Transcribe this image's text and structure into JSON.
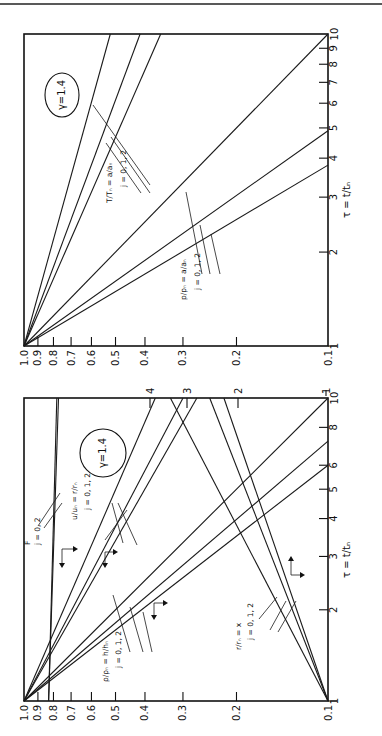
{
  "figure": {
    "orientation": "rotated 90 degrees counter-clockwise",
    "panel_count": 2
  },
  "chart_data": [
    {
      "type": "line",
      "panel": "top",
      "title": "",
      "annotation": "γ=1.4",
      "xlabel": "τ = t / t_n",
      "ylabel": "",
      "xscale": "log",
      "yscale": "log",
      "xlim": [
        1,
        10
      ],
      "ylim": [
        0.1,
        1.0
      ],
      "x_ticks": [
        "1",
        "2",
        "3",
        "4",
        "5",
        "6",
        "7",
        "8",
        "9",
        "10"
      ],
      "y_ticks": [
        "1.0",
        "0.9",
        "0.8",
        "0.7",
        "0.6",
        "0.5",
        "0.4",
        "0.3",
        "0.2",
        "0.1"
      ],
      "grid": false,
      "series": [
        {
          "name": "T/T_n = a/a_n, j=0",
          "x": [
            1,
            10
          ],
          "y": [
            1.0,
            0.52
          ]
        },
        {
          "name": "T/T_n = a/a_n, j=1",
          "x": [
            1,
            10
          ],
          "y": [
            1.0,
            0.415
          ]
        },
        {
          "name": "T/T_n = a/a_n, j=2",
          "x": [
            1,
            10
          ],
          "y": [
            1.0,
            0.355
          ]
        },
        {
          "name": "p/p_n = a/a_n, j=0",
          "x": [
            1,
            10
          ],
          "y": [
            1.0,
            0.1
          ]
        },
        {
          "name": "p/p_n = a/a_n, j=1",
          "x": [
            1,
            4.9
          ],
          "y": [
            1.0,
            0.1
          ]
        },
        {
          "name": "p/p_n = a/a_n, j=2",
          "x": [
            1,
            3.8
          ],
          "y": [
            1.0,
            0.1
          ]
        }
      ],
      "labels": [
        {
          "text": "T/T_n = a/a_n",
          "sub": "j = 0, 1, 2"
        },
        {
          "text": "p/p_n = a/a_n",
          "sub": "j = 0, 1, 2"
        }
      ]
    },
    {
      "type": "line",
      "panel": "bottom",
      "title": "",
      "annotation": "γ=1.4",
      "xlabel": "τ = t / t_n",
      "ylabel": "",
      "xscale": "log",
      "yscale": "log",
      "xlim": [
        1,
        10
      ],
      "ylim": [
        0.1,
        1.0
      ],
      "x_ticks": [
        "1",
        "2",
        "3",
        "4",
        "5",
        "6",
        "8",
        "10"
      ],
      "y_ticks": [
        "1.0",
        "0.9",
        "0.8",
        "0.7",
        "0.6",
        "0.5",
        "0.4",
        "0.3",
        "0.2",
        "0.1"
      ],
      "right_axis_ticks": [
        "1",
        "2",
        "3",
        "4"
      ],
      "grid": false,
      "series": [
        {
          "name": "F, j=0",
          "x": [
            1,
            10
          ],
          "y": [
            0.83,
            0.78
          ]
        },
        {
          "name": "F, j=2",
          "x": [
            1,
            10
          ],
          "y": [
            0.83,
            0.77
          ]
        },
        {
          "name": "u/u_n = r/r_n, j=0",
          "x": [
            1,
            10
          ],
          "y": [
            1.0,
            0.37
          ]
        },
        {
          "name": "u/u_n = r/r_n, j=1",
          "x": [
            1,
            10
          ],
          "y": [
            1.0,
            0.3
          ]
        },
        {
          "name": "u/u_n = r/r_n, j=2",
          "x": [
            1,
            10
          ],
          "y": [
            1.0,
            0.27
          ]
        },
        {
          "name": "ρ/ρ_n = h/h_n, j=0",
          "x": [
            1,
            10
          ],
          "y": [
            1.0,
            0.1
          ]
        },
        {
          "name": "ρ/ρ_n = h/h_n, j=1",
          "x": [
            1,
            7.2
          ],
          "y": [
            1.0,
            0.1
          ]
        },
        {
          "name": "ρ/ρ_n = h/h_n, j=2",
          "x": [
            1,
            6.0
          ],
          "y": [
            1.0,
            0.1
          ]
        },
        {
          "name": "r/r_n = x, j=0",
          "x": [
            1,
            10
          ],
          "y": [
            0.1,
            0.33
          ]
        },
        {
          "name": "r/r_n = x, j=1",
          "x": [
            1,
            10
          ],
          "y": [
            0.1,
            0.245
          ]
        },
        {
          "name": "r/r_n = x, j=2",
          "x": [
            1,
            10
          ],
          "y": [
            0.1,
            0.22
          ]
        }
      ],
      "labels": [
        {
          "text": "F",
          "sub": "j = 0, 2"
        },
        {
          "text": "u/u_n = r/r_n",
          "sub": "j = 0, 1, 2"
        },
        {
          "text": "ρ/ρ_n = h/h_n",
          "sub": "j = 0, 1, 2"
        },
        {
          "text": "r/r_n = x",
          "sub": "j = 0, 1, 2"
        }
      ]
    }
  ],
  "text": {
    "gamma": "γ=1.4",
    "tau_label": "τ = t/tₙ",
    "top_T_label": "T/Tₙ = a/aₙ",
    "top_p_label": "p/pₙ = a/aₙ",
    "j012": "j = 0, 1, 2",
    "j02": "j = 0, 2",
    "F_label": "F",
    "bot_u_label": "u/uₙ = r/rₙ",
    "bot_rho_label": "ρ/ρₙ = h/hₙ",
    "bot_r_label": "r/rₙ = x"
  },
  "axis_text": {
    "value_ticks": [
      "1.0",
      "0.9",
      "0.8",
      "0.7",
      "0.6",
      "0.5",
      "0.4",
      "0.3",
      "0.2",
      "0.1"
    ],
    "top_tau_ticks": [
      "1",
      "2",
      "3",
      "4",
      "5",
      "6",
      "7",
      "8",
      "9",
      "10"
    ],
    "bot_tau_ticks": [
      "1",
      "2",
      "3",
      "4",
      "5",
      "6",
      "8",
      "10"
    ],
    "bot_right_ticks": [
      "1",
      "2",
      "3",
      "4"
    ]
  }
}
